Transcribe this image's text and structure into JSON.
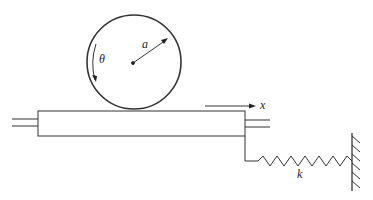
{
  "diagram": {
    "type": "mechanics-schematic",
    "labels": {
      "radius": "a",
      "angle": "θ",
      "displacement": "x",
      "spring_constant": "k"
    },
    "components": [
      {
        "id": "disk",
        "description": "circle (rolling cylinder) of radius a with center dot"
      },
      {
        "id": "platform",
        "description": "horizontal slab on rails"
      },
      {
        "id": "rails",
        "description": "double guide lines on left and right"
      },
      {
        "id": "spring",
        "description": "zigzag spring with constant k"
      },
      {
        "id": "wall",
        "description": "hatched fixed wall on right"
      }
    ],
    "colors": {
      "stroke": "#333333",
      "background": "#ffffff"
    }
  }
}
